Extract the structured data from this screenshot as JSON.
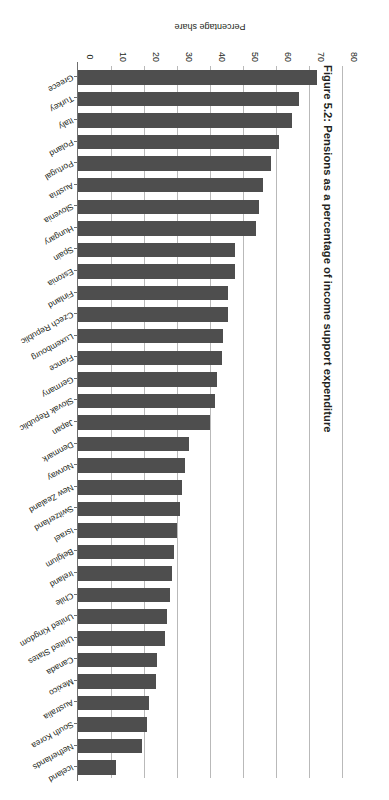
{
  "figure": {
    "title": "Figure 5.2: Pensions as a percentage of income support expenditure"
  },
  "chart_data": {
    "type": "bar",
    "orientation": "horizontal",
    "title": "Figure 5.2: Pensions as a percentage of income support expenditure",
    "xlabel": "",
    "ylabel": "Percentage share",
    "value_axis_label": "Percentage share",
    "ylim": [
      0,
      80
    ],
    "tick_labels": [
      "0",
      "10",
      "20",
      "30",
      "40",
      "50",
      "60",
      "70",
      "80"
    ],
    "tick_values": [
      0,
      10,
      20,
      30,
      40,
      50,
      60,
      70,
      80
    ],
    "grid": true,
    "grid_axis": "value",
    "legend": false,
    "bar_color": "#4e4e4e",
    "gridline_color": "#b9b9b9",
    "axis_color": "#6e6e6e",
    "categories": [
      "Iceland",
      "Netherlands",
      "South Korea",
      "Australia",
      "Mexico",
      "Canada",
      "United States",
      "United Kingdom",
      "Chile",
      "Ireland",
      "Belgium",
      "Israel",
      "Switzerland",
      "New Zealand",
      "Norway",
      "Denmark",
      "Japan",
      "Slovak Republic",
      "Germany",
      "France",
      "Luxembourg",
      "Czech Republic",
      "Finland",
      "Estonia",
      "Spain",
      "Hungary",
      "Slovenia",
      "Austria",
      "Portugal",
      "Poland",
      "Italy",
      "Turkey",
      "Greece"
    ],
    "values": [
      11.5,
      19.5,
      21.0,
      21.5,
      23.5,
      24.0,
      26.5,
      27.0,
      28.0,
      28.5,
      29.0,
      30.0,
      31.0,
      31.5,
      32.5,
      33.5,
      40.0,
      41.5,
      42.0,
      43.5,
      44.0,
      45.5,
      45.5,
      47.5,
      47.5,
      54.0,
      55.0,
      56.0,
      58.5,
      61.0,
      65.0,
      67.0,
      72.5
    ]
  }
}
